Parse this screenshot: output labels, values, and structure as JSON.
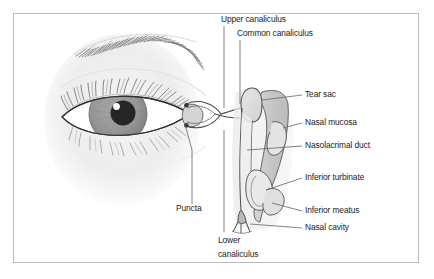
{
  "figure": {
    "border_color": "#b9b9b9",
    "background": "#ffffff",
    "text_color": "#1b1b1b",
    "leader_color": "#6d6d6d"
  },
  "palette": {
    "skin_shade": "#ededed",
    "sclera": "#ffffff",
    "iris": "#9b9b9b",
    "iris_inner": "#8a8a8a",
    "pupil": "#262626",
    "pupil_highlight": "#ffffff",
    "lash_stroke": "#5a5a5a",
    "brow_stroke": "#6a6a6a",
    "outline": "#3a3a3a",
    "mucosa_fill": "#c9c9c9",
    "cavity_fill": "#ffffff",
    "sac_fill": "#dcdcdc",
    "duct_fill": "#efefef",
    "soft_shadow": "#e8e8e8"
  },
  "labels": {
    "upper_canaliculus": "Upper canaliculus",
    "common_canaliculus": "Common canaliculus",
    "tear_sac": "Tear sac",
    "nasal_mucosa": "Nasal mucosa",
    "nasolacrimal_duct": "Nasolacrimal duct",
    "inferior_turbinate": "Inferior turbinate",
    "inferior_meatus": "Inferior meatus",
    "nasal_cavity": "Nasal cavity",
    "puncta": "Puncta",
    "lower_canaliculus_line1": "Lower",
    "lower_canaliculus_line2": "canaliculus"
  },
  "label_positions": {
    "upper_canaliculus": {
      "x": 221,
      "y": 17
    },
    "common_canaliculus": {
      "x": 237,
      "y": 31
    },
    "tear_sac": {
      "x": 305,
      "y": 92
    },
    "nasal_mucosa": {
      "x": 305,
      "y": 120
    },
    "nasolacrimal_duct": {
      "x": 305,
      "y": 143
    },
    "inferior_turbinate": {
      "x": 305,
      "y": 175
    },
    "inferior_meatus": {
      "x": 305,
      "y": 208
    },
    "nasal_cavity": {
      "x": 305,
      "y": 225
    },
    "puncta": {
      "x": 176,
      "y": 206
    },
    "lower_canaliculus": {
      "x": 218,
      "y": 238
    }
  },
  "structures": [
    {
      "name": "eyebrow",
      "description": "hatched brow hairs arching above the eye"
    },
    {
      "name": "upper-eyelid-lashes",
      "description": "fine upper lash strokes"
    },
    {
      "name": "lower-eyelid-lashes",
      "description": "fine lower lash strokes"
    },
    {
      "name": "sclera",
      "description": "white of the eye, almond aperture"
    },
    {
      "name": "iris",
      "description": "gray iris with radial striations"
    },
    {
      "name": "pupil",
      "description": "dark pupil with specular highlight"
    },
    {
      "name": "lacrimal-caruncle",
      "description": "medial canthus caruncle"
    },
    {
      "name": "upper-canaliculus",
      "description": "upper tear duct channel"
    },
    {
      "name": "lower-canaliculus",
      "description": "lower tear duct channel"
    },
    {
      "name": "common-canaliculus",
      "description": "shared channel to tear sac"
    },
    {
      "name": "tear-sac",
      "description": "lacrimal sac bulb at duct top"
    },
    {
      "name": "nasolacrimal-duct",
      "description": "vertical duct descending to nose"
    },
    {
      "name": "nasal-mucosa",
      "description": "shaded lining of nasal wall"
    },
    {
      "name": "inferior-turbinate",
      "description": "scroll-shaped turbinate bone"
    },
    {
      "name": "middle-turbinate",
      "description": "upper scroll-shaped turbinate"
    },
    {
      "name": "inferior-meatus",
      "description": "space under inferior turbinate"
    },
    {
      "name": "nasal-cavity",
      "description": "airway space of the nose"
    },
    {
      "name": "hasner-valve",
      "description": "valve at duct outlet into meatus"
    }
  ]
}
